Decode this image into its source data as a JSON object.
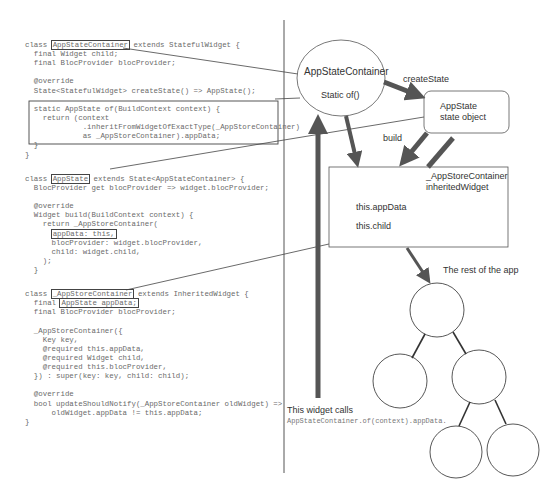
{
  "code": {
    "block1": [
      {
        "pre": "class ",
        "hl": "AppStateContainer",
        "post": " extends StatefulWidget {"
      },
      {
        "text": "  final Widget child;"
      },
      {
        "text": "  final BlocProvider blocProvider;"
      },
      {
        "text": ""
      },
      {
        "text": "  @override"
      },
      {
        "text": "  State<StatefulWidget> createState() => AppState();"
      },
      {
        "text": ""
      },
      {
        "text": "  static AppState of(BuildContext context) {"
      },
      {
        "text": "    return (context"
      },
      {
        "text": "             .inheritFromWidgetOfExactType(_AppStoreContainer)"
      },
      {
        "text": "             as _AppStoreContainer).appData;"
      },
      {
        "text": "  }"
      },
      {
        "text": "}"
      }
    ],
    "block2": [
      {
        "pre": "class ",
        "hl": "AppState",
        "post": " extends State<AppStateContainer> {"
      },
      {
        "text": "  BlocProvider get blocProvider => widget.blocProvider;"
      },
      {
        "text": ""
      },
      {
        "text": "  @override"
      },
      {
        "text": "  Widget build(BuildContext context) {"
      },
      {
        "text": "    return _AppStoreContainer("
      },
      {
        "pre": "      ",
        "hl": "appData: this,",
        "post": ""
      },
      {
        "text": "      blocProvider: widget.blocProvider,"
      },
      {
        "text": "      child: widget.child,"
      },
      {
        "text": "    );"
      },
      {
        "text": "  }"
      }
    ],
    "block3": [
      {
        "pre": "class ",
        "hl": "_AppStoreContainer",
        "post": " extends InheritedWidget {"
      },
      {
        "pre": "  final ",
        "hl": "AppState appData;",
        "post": ""
      },
      {
        "text": "  final BlocProvider blocProvider;"
      },
      {
        "text": ""
      },
      {
        "text": "  _AppStoreContainer({"
      },
      {
        "text": "    Key key,"
      },
      {
        "text": "    @required this.appData,"
      },
      {
        "text": "    @required Widget child,"
      },
      {
        "text": "    @required this.blocProvider,"
      },
      {
        "text": "  }) : super(key: key, child: child);"
      },
      {
        "text": ""
      },
      {
        "text": "  @override"
      },
      {
        "text": "  bool updateShouldNotify(_AppStoreContainer oldWidget) =>"
      },
      {
        "text": "      oldWidget.appData != this.appData;"
      },
      {
        "text": "}"
      }
    ]
  },
  "diagram": {
    "app_state_container": {
      "title": "AppStateContainer",
      "subtitle": "Static of()"
    },
    "create_state_label": "createState",
    "app_state": {
      "title": "AppState",
      "subtitle": "state object"
    },
    "build_label": "build",
    "app_store_container": {
      "title": "_AppStoreContainer",
      "subtitle": "inheritedWidget",
      "field1": "this.appData",
      "field2": "this.child"
    },
    "rest_of_app_label": "The rest of the app",
    "widget_calls_label": "This widget calls",
    "widget_calls_code": "AppStateContainer.of(context).appData."
  },
  "colors": {
    "arrow": "#555555",
    "line": "#444444",
    "code_text": "#6a6a6a"
  }
}
